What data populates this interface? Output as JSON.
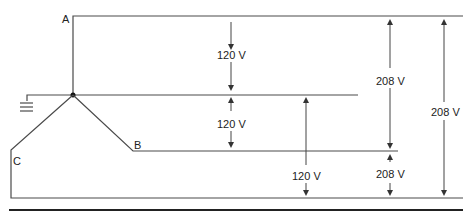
{
  "diagram": {
    "nodes": {
      "A": "A",
      "B": "B",
      "C": "C"
    },
    "measurements": [
      {
        "id": "a-n",
        "label": "120 V",
        "between": [
          "A",
          "N"
        ]
      },
      {
        "id": "n-b",
        "label": "120 V",
        "between": [
          "N",
          "B"
        ]
      },
      {
        "id": "n-c",
        "label": "120 V",
        "between": [
          "N",
          "C"
        ]
      },
      {
        "id": "a-b",
        "label": "208 V",
        "between": [
          "A",
          "B"
        ]
      },
      {
        "id": "b-c",
        "label": "208 V",
        "between": [
          "B",
          "C"
        ]
      },
      {
        "id": "a-c",
        "label": "208 V",
        "between": [
          "A",
          "C"
        ]
      }
    ],
    "ground": "ground-symbol",
    "neutral": "neutral-point"
  }
}
